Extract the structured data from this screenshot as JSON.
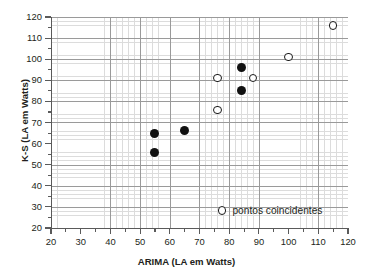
{
  "chart_data": {
    "type": "scatter",
    "title": "",
    "xlabel": "ARIMA (LA em Watts)",
    "ylabel": "K-S (LA em Watts)",
    "xlim": [
      20,
      120
    ],
    "ylim": [
      20,
      120
    ],
    "xticks": [
      20,
      30,
      40,
      50,
      60,
      70,
      80,
      90,
      100,
      110,
      120
    ],
    "yticks": [
      20,
      30,
      40,
      50,
      60,
      70,
      80,
      90,
      100,
      110,
      120
    ],
    "xtick_labels": [
      "20",
      "30",
      "40",
      "50",
      "60",
      "70",
      "80",
      "90",
      "100",
      "110",
      "120"
    ],
    "ytick_labels": [
      "20",
      "30",
      "40",
      "50",
      "60",
      "70",
      "80",
      "90",
      "100",
      "110",
      "120"
    ],
    "minor_tick_step": 2,
    "grid": true,
    "grid_major_step": 10,
    "grid_minor_step": 2,
    "legend_position": "bottom-right",
    "series": [
      {
        "name": "pontos",
        "marker": "filled-circle",
        "color": "#111111",
        "points": [
          {
            "x": 55,
            "y": 65
          },
          {
            "x": 55,
            "y": 56
          },
          {
            "x": 65,
            "y": 66
          },
          {
            "x": 84,
            "y": 96
          },
          {
            "x": 84,
            "y": 85
          }
        ]
      },
      {
        "name": "pontos coincidentes",
        "marker": "open-circle",
        "color": "#1a1a1a",
        "points": [
          {
            "x": 76,
            "y": 91
          },
          {
            "x": 76,
            "y": 76
          },
          {
            "x": 88,
            "y": 91
          },
          {
            "x": 100,
            "y": 101
          },
          {
            "x": 115,
            "y": 116
          }
        ]
      }
    ],
    "legend": [
      {
        "label": "pontos coincidentes",
        "marker": "open-circle"
      }
    ]
  }
}
